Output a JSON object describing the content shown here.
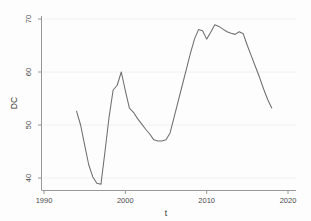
{
  "chart_data": {
    "type": "line",
    "title": "",
    "xlabel": "t",
    "ylabel": "DC",
    "xlim": [
      1990,
      2020
    ],
    "ylim": [
      38,
      71
    ],
    "xticks": [
      1990,
      2000,
      2010,
      2020
    ],
    "xtick_labels": [
      "1990",
      "2000",
      "2010",
      "2020"
    ],
    "yticks": [
      40,
      50,
      60,
      70
    ],
    "ytick_labels": [
      "40",
      "50",
      "60",
      "70"
    ],
    "grid": true,
    "legend": null,
    "series": [
      {
        "name": "DC",
        "color": "#6e6e6e",
        "x": [
          1994.0,
          1994.5,
          1995.0,
          1995.5,
          1996.0,
          1996.5,
          1997.0,
          1997.5,
          1998.0,
          1998.5,
          1999.0,
          1999.5,
          2000.0,
          2000.5,
          2001.0,
          2001.5,
          2002.0,
          2002.5,
          2003.0,
          2003.5,
          2004.0,
          2004.5,
          2005.0,
          2005.5,
          2006.0,
          2006.5,
          2007.0,
          2007.5,
          2008.0,
          2008.5,
          2009.0,
          2009.5,
          2010.0,
          2010.5,
          2011.0,
          2011.5,
          2012.0,
          2012.5,
          2013.0,
          2013.5,
          2014.0,
          2014.5,
          2015.0,
          2015.5,
          2016.0,
          2016.5,
          2017.0,
          2017.5,
          2018.0
        ],
        "y": [
          52.6,
          50.0,
          46.2,
          42.5,
          40.2,
          39.0,
          38.8,
          45.0,
          51.5,
          56.6,
          57.5,
          60.0,
          56.5,
          53.2,
          52.4,
          51.2,
          50.2,
          49.2,
          48.3,
          47.2,
          47.0,
          47.0,
          47.2,
          48.5,
          51.5,
          54.5,
          57.5,
          60.5,
          63.5,
          66.2,
          68.0,
          67.8,
          66.2,
          67.5,
          68.9,
          68.6,
          68.1,
          67.6,
          67.3,
          67.1,
          67.6,
          67.2,
          65.0,
          63.0,
          61.0,
          59.0,
          56.8,
          54.8,
          53.2
        ]
      }
    ]
  },
  "axes": {
    "y_axis_label": "DC",
    "x_axis_label": "t"
  }
}
